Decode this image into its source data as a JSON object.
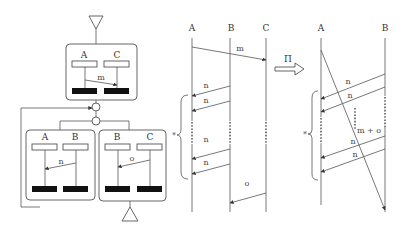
{
  "figure": {
    "left_panel": {
      "name": "composition-diagram",
      "top_box": {
        "lifelines": [
          "A",
          "C"
        ],
        "message": "m"
      },
      "bottom_left_box": {
        "lifelines": [
          "A",
          "B"
        ],
        "message": "n"
      },
      "bottom_right_box": {
        "lifelines": [
          "B",
          "C"
        ],
        "message": "o"
      }
    },
    "middle_panel": {
      "name": "sequence-before",
      "lifelines": [
        "A",
        "B",
        "C"
      ],
      "messages": [
        "m",
        "n",
        "n",
        "n",
        "n",
        "o"
      ],
      "repeat_marker": "*"
    },
    "transform_arrow": {
      "label": "Π"
    },
    "right_panel": {
      "name": "sequence-after",
      "lifelines": [
        "A",
        "B"
      ],
      "messages": [
        "n",
        "n",
        "m + o",
        "n",
        "n"
      ],
      "repeat_marker": "*"
    }
  }
}
